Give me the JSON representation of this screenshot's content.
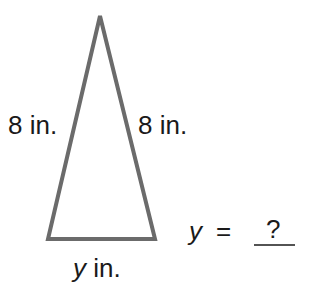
{
  "diagram": {
    "shape": "isosceles triangle",
    "stroke_color": "#6b6b6b",
    "vertices": {
      "apex": [
        100,
        16
      ],
      "bottom_left": [
        48,
        239
      ],
      "bottom_right": [
        155,
        239
      ]
    },
    "labels": {
      "left_side": "8 in.",
      "right_side": "8 in.",
      "base_var": "y",
      "base_unit": " in."
    }
  },
  "equation": {
    "var": "y",
    "equals": "=",
    "answer": "?"
  }
}
